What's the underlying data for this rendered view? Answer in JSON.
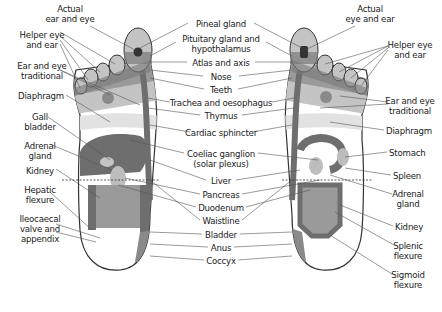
{
  "diagram": {
    "feet": [
      "left-foot",
      "right-foot"
    ],
    "colors": {
      "outline": "#333333",
      "dark": "#6e6e6e",
      "mid": "#9a9a9a",
      "light": "#c4c4c4",
      "pale": "#e2e2e2",
      "leader": "#555555"
    },
    "left_labels": [
      {
        "id": "actual-ear-eye",
        "text": "Actual\near and eye",
        "x": 70,
        "y": 4,
        "align": "c"
      },
      {
        "id": "helper-eye-ear-left",
        "text": "Helper eye\nand ear",
        "x": 42,
        "y": 30,
        "align": "c"
      },
      {
        "id": "ear-eye-traditional-left",
        "text": "Ear and eye\ntraditional",
        "x": 42,
        "y": 61,
        "align": "c"
      },
      {
        "id": "diaphragm-left",
        "text": "Diaphragm",
        "x": 64,
        "y": 91,
        "align": "r"
      },
      {
        "id": "gall-bladder",
        "text": "Gall\nbladder",
        "x": 40,
        "y": 112,
        "align": "c"
      },
      {
        "id": "adrenal-gland-left",
        "text": "Adrenal\ngland",
        "x": 40,
        "y": 141,
        "align": "c"
      },
      {
        "id": "kidney-left",
        "text": "Kidney",
        "x": 54,
        "y": 166,
        "align": "r"
      },
      {
        "id": "hepatic-flexure",
        "text": "Hepatic\nflexure",
        "x": 40,
        "y": 185,
        "align": "c"
      },
      {
        "id": "ileocaecal-valve",
        "text": "Ileocaecal\nvalve and\nappendix",
        "x": 40,
        "y": 214,
        "align": "c"
      }
    ],
    "center_labels": [
      {
        "id": "pineal-gland",
        "text": "Pineal gland",
        "x": 221,
        "y": 19
      },
      {
        "id": "pituitary-gland",
        "text": "Pituitary gland and\nhypothalamus",
        "x": 221,
        "y": 34
      },
      {
        "id": "atlas-axis",
        "text": "Atlas and axis",
        "x": 221,
        "y": 58
      },
      {
        "id": "nose",
        "text": "Nose",
        "x": 221,
        "y": 72
      },
      {
        "id": "teeth",
        "text": "Teeth",
        "x": 221,
        "y": 85
      },
      {
        "id": "trachea",
        "text": "Trachea and oesophagus",
        "x": 221,
        "y": 98
      },
      {
        "id": "thymus",
        "text": "Thymus",
        "x": 221,
        "y": 111
      },
      {
        "id": "cardiac-sphincter",
        "text": "Cardiac sphincter",
        "x": 221,
        "y": 128
      },
      {
        "id": "coeliac-ganglion",
        "text": "Coeliac ganglion\n(solar plexus)",
        "x": 221,
        "y": 149
      },
      {
        "id": "liver",
        "text": "Liver",
        "x": 221,
        "y": 176
      },
      {
        "id": "pancreas",
        "text": "Pancreas",
        "x": 221,
        "y": 190
      },
      {
        "id": "duodenum",
        "text": "Duodenum",
        "x": 221,
        "y": 203
      },
      {
        "id": "waistline",
        "text": "Waistline",
        "x": 221,
        "y": 216
      },
      {
        "id": "bladder",
        "text": "Bladder",
        "x": 221,
        "y": 230
      },
      {
        "id": "anus",
        "text": "Anus",
        "x": 221,
        "y": 243
      },
      {
        "id": "coccyx",
        "text": "Coccyx",
        "x": 221,
        "y": 256
      }
    ],
    "right_labels": [
      {
        "id": "actual-eye-ear",
        "text": "Actual\neye and ear",
        "x": 370,
        "y": 4,
        "align": "c"
      },
      {
        "id": "helper-eye-ear-right",
        "text": "Helper eye\nand ear",
        "x": 410,
        "y": 40,
        "align": "c"
      },
      {
        "id": "ear-eye-traditional-right",
        "text": "Ear and eye\ntraditional",
        "x": 410,
        "y": 96,
        "align": "c",
        "dy": -1
      },
      {
        "id": "diaphragm-right",
        "text": "Diaphragm",
        "x": 386,
        "y": 126,
        "align": "l"
      },
      {
        "id": "stomach",
        "text": "Stomach",
        "x": 389,
        "y": 148,
        "align": "l"
      },
      {
        "id": "spleen",
        "text": "Spleen",
        "x": 393,
        "y": 171,
        "align": "l"
      },
      {
        "id": "adrenal-gland-right",
        "text": "Adrenal\ngland",
        "x": 408,
        "y": 189,
        "align": "c"
      },
      {
        "id": "kidney-right",
        "text": "Kidney",
        "x": 395,
        "y": 222,
        "align": "l"
      },
      {
        "id": "splenic-flexure",
        "text": "Splenic\nflexure",
        "x": 408,
        "y": 241,
        "align": "c"
      },
      {
        "id": "sigmoid-flexure",
        "text": "Sigmoid\nflexure",
        "x": 408,
        "y": 270,
        "align": "c"
      }
    ]
  }
}
